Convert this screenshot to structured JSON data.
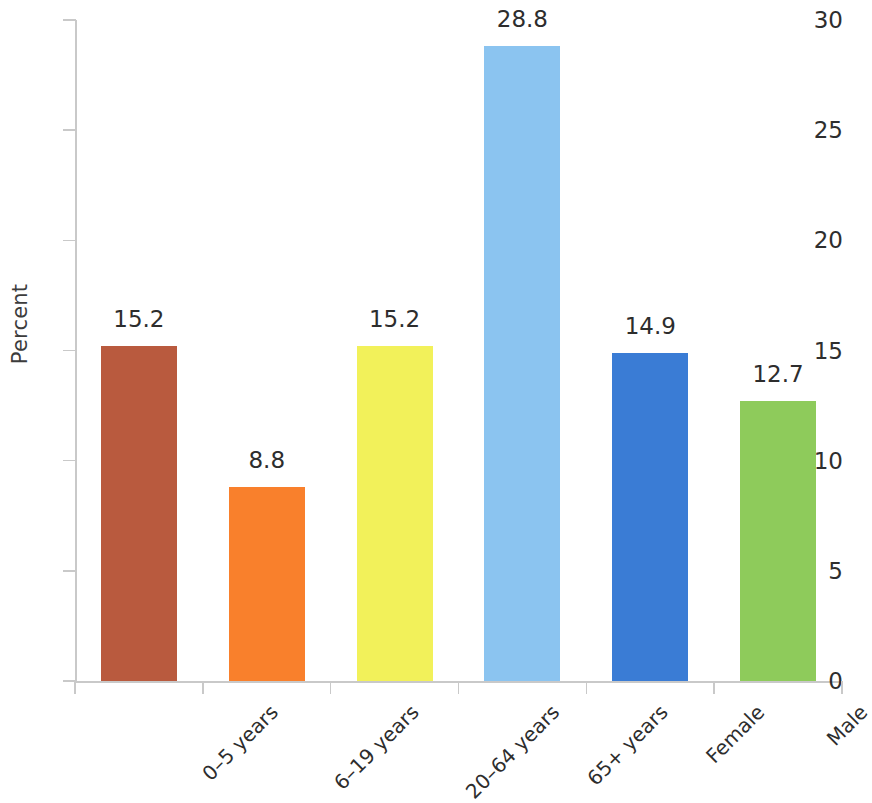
{
  "chart_data": {
    "type": "bar",
    "title": "",
    "xlabel": "",
    "ylabel": "Percent",
    "ylim": [
      0,
      30
    ],
    "yticks": [
      0,
      5,
      10,
      15,
      20,
      25,
      30
    ],
    "ytick_labels": [
      "0",
      "5",
      "10",
      "15",
      "20",
      "25",
      "30"
    ],
    "grid": false,
    "legend": "none",
    "categories": [
      "0–5 years",
      "6–19 years",
      "20–64 years",
      "65+ years",
      "Female",
      "Male"
    ],
    "values": [
      15.2,
      8.8,
      15.2,
      28.8,
      14.9,
      12.7
    ],
    "value_labels": [
      "15.2",
      "8.8",
      "15.2",
      "28.8",
      "14.9",
      "12.7"
    ],
    "bar_colors": [
      "#b95a3e",
      "#f9802c",
      "#f2f15a",
      "#8bc4f0",
      "#3a7cd5",
      "#8ecb5b"
    ],
    "label_rotation": -45,
    "axis_color": "#c9c9c9",
    "text_color": "#2d2d2d"
  }
}
